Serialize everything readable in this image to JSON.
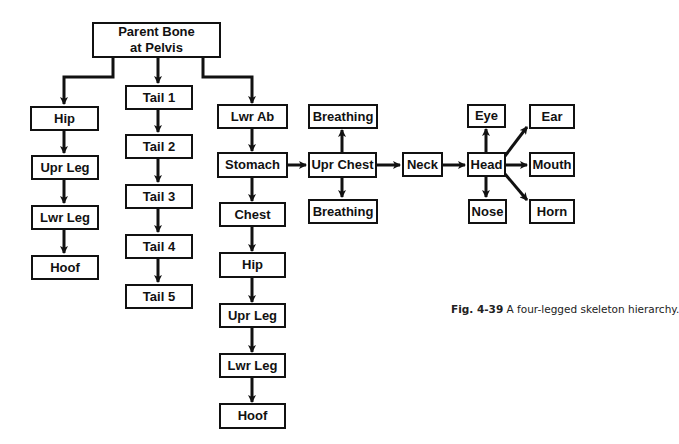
{
  "figure": {
    "caption_label": "Fig. 4-39",
    "caption_text": " A four-legged skeleton hierarchy."
  },
  "nodes": {
    "root_line1": "Parent Bone",
    "root_line2": "at Pelvis",
    "hip_left": "Hip",
    "upr_leg_left": "Upr Leg",
    "lwr_leg_left": "Lwr Leg",
    "hoof_left": "Hoof",
    "tail1": "Tail 1",
    "tail2": "Tail 2",
    "tail3": "Tail 3",
    "tail4": "Tail 4",
    "tail5": "Tail 5",
    "lwr_ab": "Lwr Ab",
    "stomach": "Stomach",
    "chest": "Chest",
    "hip_right": "Hip",
    "upr_leg_right": "Upr Leg",
    "lwr_leg_right": "Lwr Leg",
    "hoof_right": "Hoof",
    "breathing_top": "Breathing",
    "upr_chest": "Upr Chest",
    "breathing_bottom": "Breathing",
    "neck": "Neck",
    "head": "Head",
    "eye": "Eye",
    "nose": "Nose",
    "ear": "Ear",
    "mouth": "Mouth",
    "horn": "Horn"
  },
  "colors": {
    "line": "#111111",
    "background": "#ffffff"
  }
}
